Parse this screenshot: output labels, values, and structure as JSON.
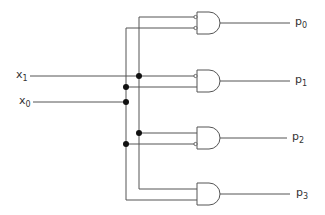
{
  "diagram": {
    "type": "2-to-4 decoder logic circuit",
    "inputs": [
      {
        "id": "x1",
        "label": "x",
        "subscript": "1"
      },
      {
        "id": "x0",
        "label": "x",
        "subscript": "0"
      }
    ],
    "outputs": [
      {
        "id": "p0",
        "label": "p",
        "subscript": "0",
        "expression": "x1' · x0'"
      },
      {
        "id": "p1",
        "label": "p",
        "subscript": "1",
        "expression": "x1' · x0"
      },
      {
        "id": "p2",
        "label": "p",
        "subscript": "2",
        "expression": "x1 · x0'"
      },
      {
        "id": "p3",
        "label": "p",
        "subscript": "3",
        "expression": "x1 · x0"
      }
    ],
    "gates": [
      {
        "type": "AND",
        "output": "p0",
        "inverted_inputs": [
          "top",
          "bottom"
        ]
      },
      {
        "type": "AND",
        "output": "p1",
        "inverted_inputs": [
          "top"
        ]
      },
      {
        "type": "AND",
        "output": "p2",
        "inverted_inputs": [
          "bottom"
        ]
      },
      {
        "type": "AND",
        "output": "p3",
        "inverted_inputs": []
      }
    ],
    "colors": {
      "wire": "#555555",
      "junction": "#111111",
      "background": "#ffffff"
    }
  }
}
